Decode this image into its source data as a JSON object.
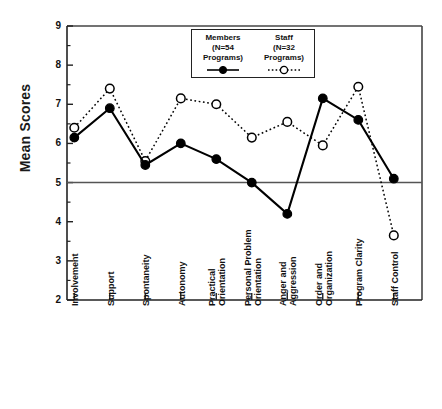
{
  "chart_data": {
    "type": "line",
    "title": "",
    "xlabel": "",
    "ylabel": "Mean Scores",
    "ylim": [
      2,
      9
    ],
    "yticks": [
      2,
      3,
      4,
      5,
      6,
      7,
      8,
      9
    ],
    "ytick_labels": [
      "2",
      "3",
      "4",
      "5",
      "6",
      "7",
      "8",
      "9"
    ],
    "grid": false,
    "reference_line": 5,
    "legend_position": "top-center",
    "categories": [
      "Involvement",
      "Support",
      "Spontaneity",
      "Autonomy",
      "Practical Orientation",
      "Personal Problem Orientation",
      "Anger and Aggression",
      "Order and Organization",
      "Program Clarity",
      "Staff Control"
    ],
    "category_lines": [
      [
        "Involvement",
        ""
      ],
      [
        "Support",
        ""
      ],
      [
        "Spontaneity",
        ""
      ],
      [
        "Autonomy",
        ""
      ],
      [
        "Practical",
        "Orientation"
      ],
      [
        "Personal Problem",
        "Orientation"
      ],
      [
        "Anger and",
        "Aggression"
      ],
      [
        "Order and",
        "Organization"
      ],
      [
        "Program Clarity",
        ""
      ],
      [
        "Staff Control",
        ""
      ]
    ],
    "series": [
      {
        "name": "Members",
        "detail": "(N=54 Programs)",
        "marker": "filled-circle",
        "linestyle": "solid",
        "color": "#000000",
        "values": [
          6.15,
          6.9,
          5.45,
          6.0,
          5.6,
          5.0,
          4.2,
          7.15,
          6.6,
          5.1
        ]
      },
      {
        "name": "Staff",
        "detail": "(N=32 Programs)",
        "marker": "open-circle",
        "linestyle": "dotted",
        "color": "#000000",
        "values": [
          6.4,
          7.4,
          5.55,
          7.15,
          7.0,
          6.15,
          6.55,
          5.95,
          7.45,
          3.65
        ]
      }
    ]
  },
  "legend": {
    "series": [
      {
        "title": "Members",
        "line1": "(N=54",
        "line2": "Programs)"
      },
      {
        "title": "Staff",
        "line1": "(N=32",
        "line2": "Programs)"
      }
    ]
  }
}
